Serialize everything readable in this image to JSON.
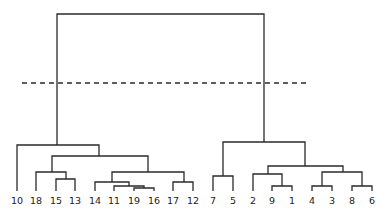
{
  "diagram": {
    "type": "dendrogram",
    "line_color": "#2a2a2a",
    "cut_line": {
      "style": "dashed",
      "y": 83,
      "x1": 22,
      "x2": 308
    },
    "leaves": [
      {
        "label": "10",
        "x": 17
      },
      {
        "label": "18",
        "x": 36
      },
      {
        "label": "15",
        "x": 56
      },
      {
        "label": "13",
        "x": 75
      },
      {
        "label": "14",
        "x": 95
      },
      {
        "label": "11",
        "x": 114
      },
      {
        "label": "19",
        "x": 134
      },
      {
        "label": "16",
        "x": 154
      },
      {
        "label": "17",
        "x": 173
      },
      {
        "label": "12",
        "x": 193
      },
      {
        "label": "7",
        "x": 213
      },
      {
        "label": "5",
        "x": 233
      },
      {
        "label": "2",
        "x": 253
      },
      {
        "label": "9",
        "x": 272
      },
      {
        "label": "1",
        "x": 292
      },
      {
        "label": "4",
        "x": 312
      },
      {
        "label": "3",
        "x": 332
      },
      {
        "label": "8",
        "x": 352
      },
      {
        "label": "6",
        "x": 372
      }
    ],
    "clusters_at_cut": [
      [
        "10",
        "18",
        "15",
        "13",
        "14",
        "11",
        "19",
        "16",
        "17",
        "12"
      ],
      [
        "7",
        "5",
        "2",
        "9",
        "1",
        "4",
        "3",
        "8",
        "6"
      ]
    ]
  }
}
